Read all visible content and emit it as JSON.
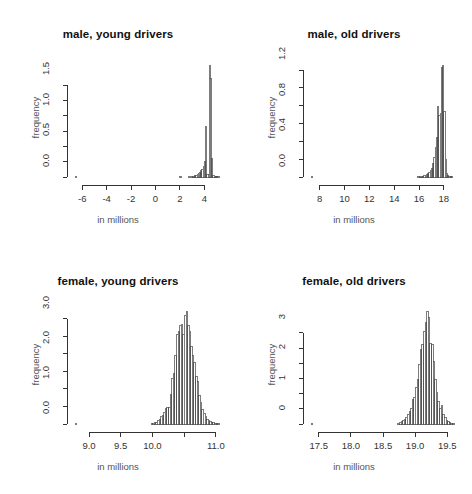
{
  "figure": {
    "layout": "2x2 panel of histograms",
    "background": "#ffffff",
    "bar_fill": "#ffffff",
    "bar_stroke": "#444444",
    "axis_color": "#333333"
  },
  "chart_data": [
    {
      "type": "bar",
      "id": "male-young-drivers",
      "title": "male, young drivers",
      "xlabel": "in millions",
      "ylabel": "frequency",
      "xlim": [
        -6.6,
        5.2
      ],
      "ylim": [
        0,
        1.86
      ],
      "xticks": [
        -6,
        -4,
        -2,
        0,
        2,
        4
      ],
      "xticklabels": [
        "-6",
        "-4",
        "-2",
        "0",
        "2",
        "4"
      ],
      "yticks": [
        0.0,
        0.5,
        1.0,
        1.5
      ],
      "yticklabels": [
        "0.0",
        "0.5",
        "1.0",
        "1.5"
      ],
      "grid": false,
      "legend": "none",
      "bin_width": 0.1,
      "bin_starts": [
        -6.6,
        -6.5,
        -6.4,
        -6.3,
        -6.2,
        -6.1,
        -6.0,
        -5.9,
        -5.8,
        -5.7,
        -5.6,
        -5.5,
        -5.4,
        -5.3,
        -5.2,
        -5.1,
        -5.0,
        -4.9,
        -4.8,
        -4.7,
        -4.6,
        -4.5,
        -4.4,
        -4.3,
        -4.2,
        -4.1,
        -4.0,
        -3.9,
        -3.8,
        -3.7,
        -3.6,
        -3.5,
        -3.4,
        -3.3,
        -3.2,
        -3.1,
        -3.0,
        -2.9,
        -2.8,
        -2.7,
        -2.6,
        -2.5,
        -2.4,
        -2.3,
        -2.2,
        -2.1,
        -2.0,
        -1.9,
        -1.8,
        -1.7,
        -1.6,
        -1.5,
        -1.4,
        -1.3,
        -1.2,
        -1.1,
        -1.0,
        -0.9,
        -0.8,
        -0.7,
        -0.6,
        -0.5,
        -0.4,
        -0.3,
        -0.2,
        -0.1,
        0.0,
        0.1,
        0.2,
        0.3,
        0.4,
        0.5,
        0.6,
        0.7,
        0.8,
        0.9,
        1.0,
        1.1,
        1.2,
        1.3,
        1.4,
        1.5,
        1.6,
        1.7,
        1.8,
        1.9,
        2.0,
        2.1,
        2.2,
        2.3,
        2.4,
        2.5,
        2.6,
        2.7,
        2.8,
        2.9,
        3.0,
        3.1,
        3.2,
        3.3,
        3.4,
        3.5,
        3.6,
        3.7,
        3.8,
        3.9,
        4.0,
        4.1,
        4.2,
        4.3,
        4.4,
        4.5,
        4.6,
        4.7,
        4.8,
        4.9,
        5.0,
        5.1
      ],
      "values": [
        0.004,
        0,
        0,
        0,
        0,
        0,
        0,
        0,
        0,
        0,
        0,
        0,
        0,
        0,
        0,
        0,
        0,
        0,
        0,
        0,
        0,
        0,
        0,
        0,
        0,
        0,
        0,
        0,
        0,
        0,
        0,
        0,
        0,
        0,
        0,
        0,
        0,
        0,
        0,
        0,
        0,
        0,
        0,
        0,
        0,
        0,
        0,
        0,
        0,
        0,
        0,
        0,
        0,
        0,
        0,
        0,
        0,
        0,
        0,
        0,
        0,
        0,
        0,
        0,
        0,
        0,
        0,
        0,
        0,
        0,
        0,
        0,
        0,
        0,
        0,
        0,
        0,
        0,
        0,
        0,
        0,
        0,
        0,
        0,
        0,
        0,
        0.004,
        0,
        0,
        0,
        0,
        0,
        0,
        0.004,
        0,
        0.008,
        0.008,
        0.012,
        0.02,
        0.03,
        0.045,
        0.06,
        0.075,
        0.1,
        0.13,
        0.17,
        0.26,
        0.82,
        0.04,
        0.04,
        1.82,
        1.6,
        0.31,
        0.02,
        0.012,
        0.006,
        0.004,
        0.002
      ]
    },
    {
      "type": "bar",
      "id": "male-old-drivers",
      "title": "male, old drivers",
      "xlabel": "in millions",
      "ylabel": "frequency",
      "xlim": [
        7.3,
        18.9
      ],
      "ylim": [
        0,
        1.28
      ],
      "xticks": [
        8,
        10,
        12,
        14,
        16,
        18
      ],
      "xticklabels": [
        "8",
        "10",
        "12",
        "14",
        "16",
        "18"
      ],
      "yticks": [
        0.0,
        0.4,
        0.8,
        1.2
      ],
      "yticklabels": [
        "0.0",
        "0.4",
        "0.8",
        "1.2"
      ],
      "grid": false,
      "legend": "none",
      "bin_width": 0.1,
      "bin_starts": [
        7.3,
        7.4,
        7.5,
        7.6,
        7.7,
        7.8,
        7.9,
        8.0,
        8.1,
        8.2,
        8.3,
        8.4,
        8.5,
        8.6,
        8.7,
        8.8,
        8.9,
        9.0,
        9.1,
        9.2,
        9.3,
        9.4,
        9.5,
        9.6,
        9.7,
        9.8,
        9.9,
        10.0,
        10.1,
        10.2,
        10.3,
        10.4,
        10.5,
        10.6,
        10.7,
        10.8,
        10.9,
        11.0,
        11.1,
        11.2,
        11.3,
        11.4,
        11.5,
        11.6,
        11.7,
        11.8,
        11.9,
        12.0,
        12.1,
        12.2,
        12.3,
        12.4,
        12.5,
        12.6,
        12.7,
        12.8,
        12.9,
        13.0,
        13.1,
        13.2,
        13.3,
        13.4,
        13.5,
        13.6,
        13.7,
        13.8,
        13.9,
        14.0,
        14.1,
        14.2,
        14.3,
        14.4,
        14.5,
        14.6,
        14.7,
        14.8,
        14.9,
        15.0,
        15.1,
        15.2,
        15.3,
        15.4,
        15.5,
        15.6,
        15.7,
        15.8,
        15.9,
        16.0,
        16.1,
        16.2,
        16.3,
        16.4,
        16.5,
        16.6,
        16.7,
        16.8,
        16.9,
        17.0,
        17.1,
        17.2,
        17.3,
        17.4,
        17.5,
        17.6,
        17.7,
        17.8,
        17.9,
        18.0,
        18.1,
        18.2,
        18.3,
        18.4,
        18.5,
        18.6,
        18.7,
        18.8
      ],
      "values": [
        0.003,
        0,
        0,
        0,
        0,
        0,
        0,
        0,
        0,
        0,
        0,
        0,
        0,
        0,
        0,
        0,
        0,
        0,
        0,
        0,
        0,
        0,
        0,
        0,
        0,
        0,
        0,
        0,
        0,
        0,
        0,
        0,
        0,
        0,
        0,
        0,
        0,
        0,
        0,
        0,
        0,
        0,
        0,
        0,
        0,
        0,
        0,
        0,
        0,
        0,
        0,
        0,
        0,
        0,
        0,
        0,
        0,
        0,
        0,
        0,
        0,
        0,
        0,
        0,
        0,
        0,
        0,
        0,
        0,
        0,
        0,
        0,
        0,
        0,
        0,
        0,
        0,
        0,
        0,
        0,
        0,
        0,
        0,
        0,
        0,
        0,
        0.004,
        0.004,
        0.006,
        0.008,
        0.01,
        0.014,
        0.02,
        0.026,
        0.035,
        0.05,
        0.07,
        0.1,
        0.15,
        0.22,
        0.33,
        0.44,
        0.79,
        0.69,
        0.71,
        1.23,
        1.25,
        0.74,
        0.2,
        0.04,
        0.014,
        0.008,
        0.004,
        0.002
      ]
    },
    {
      "type": "bar",
      "id": "female-young-drivers",
      "title": "female, young drivers",
      "xlabel": "in millions",
      "ylabel": "frequency",
      "xlim": [
        8.78,
        11.05
      ],
      "ylim": [
        0,
        3.25
      ],
      "xticks": [
        9.0,
        9.5,
        10.0,
        10.5,
        11.0
      ],
      "xticklabels": [
        "9.0",
        "9.5",
        "10.0",
        "",
        "11.0"
      ],
      "yticks": [
        0.0,
        1.0,
        2.0,
        3.0
      ],
      "yticklabels": [
        "0.0",
        "1.0",
        "2.0",
        "3.0"
      ],
      "grid": false,
      "legend": "none",
      "bin_width": 0.025,
      "bin_starts": [
        8.78,
        8.805,
        8.83,
        8.855,
        8.88,
        8.905,
        8.93,
        8.955,
        8.98,
        9.005,
        9.03,
        9.055,
        9.08,
        9.105,
        9.13,
        9.155,
        9.18,
        9.205,
        9.23,
        9.255,
        9.28,
        9.305,
        9.33,
        9.355,
        9.38,
        9.405,
        9.43,
        9.455,
        9.48,
        9.505,
        9.53,
        9.555,
        9.58,
        9.605,
        9.63,
        9.655,
        9.68,
        9.705,
        9.73,
        9.755,
        9.78,
        9.805,
        9.83,
        9.855,
        9.88,
        9.905,
        9.93,
        9.955,
        9.98,
        10.005,
        10.03,
        10.055,
        10.08,
        10.105,
        10.13,
        10.155,
        10.18,
        10.205,
        10.23,
        10.255,
        10.28,
        10.305,
        10.33,
        10.355,
        10.38,
        10.405,
        10.43,
        10.455,
        10.48,
        10.505,
        10.53,
        10.555,
        10.58,
        10.605,
        10.63,
        10.655,
        10.68,
        10.705,
        10.73,
        10.755,
        10.78,
        10.805,
        10.83,
        10.855,
        10.88,
        10.905,
        10.93,
        10.955,
        10.98,
        11.005,
        11.03
      ],
      "values": [
        0.004,
        0,
        0,
        0,
        0,
        0,
        0,
        0,
        0,
        0,
        0,
        0,
        0,
        0,
        0,
        0,
        0,
        0,
        0,
        0,
        0,
        0,
        0,
        0,
        0,
        0,
        0,
        0,
        0,
        0,
        0,
        0,
        0,
        0,
        0,
        0,
        0,
        0,
        0,
        0,
        0,
        0,
        0,
        0,
        0,
        0,
        0,
        0,
        0.01,
        0.02,
        0.03,
        0.05,
        0.09,
        0.14,
        0.2,
        0.25,
        0.32,
        0.45,
        0.46,
        0.48,
        0.85,
        1.3,
        1.45,
        1.95,
        2.55,
        2.65,
        2.8,
        2.85,
        2.55,
        3.1,
        3.2,
        2.8,
        2.65,
        2.2,
        1.95,
        1.75,
        1.35,
        1.2,
        0.82,
        0.62,
        0.42,
        0.3,
        0.22,
        0.14,
        0.1,
        0.06,
        0.04,
        0.03,
        0.02,
        0.012,
        0.006
      ]
    },
    {
      "type": "bar",
      "id": "female-old-drivers",
      "title": "female, old drivers",
      "xlabel": "in millions",
      "ylabel": "frequency",
      "xlim": [
        17.38,
        19.62
      ],
      "ylim": [
        0,
        3.75
      ],
      "xticks": [
        17.5,
        18.0,
        18.5,
        19.0,
        19.5
      ],
      "xticklabels": [
        "17.5",
        "18.0",
        "18.5",
        "19.0",
        "19.5"
      ],
      "yticks": [
        0,
        1,
        2,
        3
      ],
      "yticklabels": [
        "0",
        "1",
        "2",
        "3"
      ],
      "grid": false,
      "legend": "none",
      "bin_width": 0.025,
      "bin_starts": [
        17.38,
        17.405,
        17.43,
        17.455,
        17.48,
        17.505,
        17.53,
        17.555,
        17.58,
        17.605,
        17.63,
        17.655,
        17.68,
        17.705,
        17.73,
        17.755,
        17.78,
        17.805,
        17.83,
        17.855,
        17.88,
        17.905,
        17.93,
        17.955,
        17.98,
        18.005,
        18.03,
        18.055,
        18.08,
        18.105,
        18.13,
        18.155,
        18.18,
        18.205,
        18.23,
        18.255,
        18.28,
        18.305,
        18.33,
        18.355,
        18.38,
        18.405,
        18.43,
        18.455,
        18.48,
        18.505,
        18.53,
        18.555,
        18.58,
        18.605,
        18.63,
        18.655,
        18.68,
        18.705,
        18.73,
        18.755,
        18.78,
        18.805,
        18.83,
        18.855,
        18.88,
        18.905,
        18.93,
        18.955,
        18.98,
        19.005,
        19.03,
        19.055,
        19.08,
        19.105,
        19.13,
        19.155,
        19.18,
        19.205,
        19.23,
        19.255,
        19.28,
        19.305,
        19.33,
        19.355,
        19.38,
        19.405,
        19.43,
        19.455,
        19.48,
        19.505,
        19.53,
        19.555,
        19.58
      ],
      "values": [
        0.004,
        0,
        0,
        0,
        0,
        0,
        0,
        0,
        0,
        0,
        0,
        0,
        0,
        0,
        0,
        0,
        0,
        0,
        0,
        0,
        0,
        0,
        0,
        0,
        0,
        0,
        0,
        0,
        0,
        0,
        0,
        0,
        0,
        0,
        0,
        0,
        0,
        0,
        0,
        0,
        0,
        0,
        0,
        0,
        0,
        0,
        0,
        0,
        0,
        0,
        0,
        0,
        0,
        0,
        0.02,
        0.04,
        0.07,
        0.1,
        0.16,
        0.22,
        0.3,
        0.42,
        0.5,
        0.82,
        0.86,
        1.2,
        1.45,
        1.95,
        2.45,
        2.6,
        3.05,
        3.35,
        3.7,
        3.5,
        2.65,
        2.6,
        2.05,
        1.45,
        1.05,
        0.75,
        0.52,
        0.62,
        0.32,
        0.2,
        0.12,
        0.07,
        0.04,
        0.02,
        0.01
      ]
    }
  ]
}
